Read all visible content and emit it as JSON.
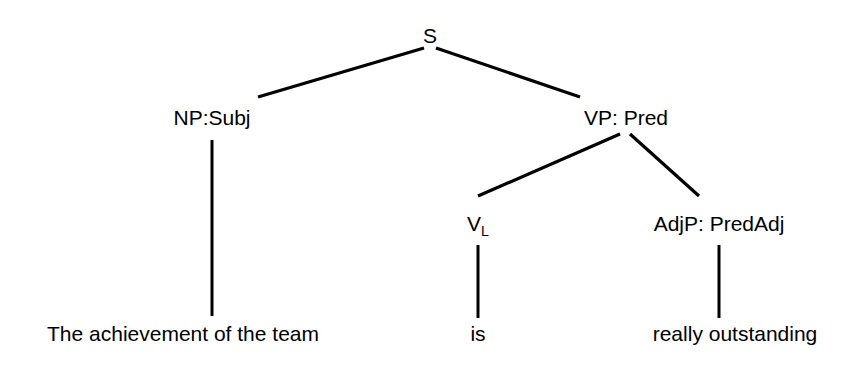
{
  "diagram": {
    "type": "syntax-tree",
    "title": "",
    "background_color": "#ffffff",
    "line_color": "#000000",
    "text_color": "#000000",
    "nodes": {
      "s": {
        "label": "S",
        "x": 430,
        "y": 40
      },
      "np_subj": {
        "label": "NP:Subj",
        "x": 212,
        "y": 122
      },
      "vp_pred": {
        "label": "VP: Pred",
        "x": 626,
        "y": 122
      },
      "v_link": {
        "label_main": "V",
        "label_sub": "L",
        "x": 478,
        "y": 228
      },
      "adjp_predadj": {
        "label": "AdjP: PredAdj",
        "x": 719,
        "y": 228
      }
    },
    "leaves": {
      "subject_text": {
        "label": "The achievement of the team",
        "x": 183,
        "y": 338
      },
      "verb_text": {
        "label": "is",
        "x": 478,
        "y": 338
      },
      "predicate_text": {
        "label": "really outstanding",
        "x": 735,
        "y": 338
      }
    },
    "edges": [
      {
        "name": "s-to-np",
        "x1": 424,
        "y1": 48,
        "x2": 258,
        "y2": 97
      },
      {
        "name": "s-to-vp",
        "x1": 436,
        "y1": 48,
        "x2": 580,
        "y2": 97
      },
      {
        "name": "np-to-subject-text",
        "x1": 212,
        "y1": 140,
        "x2": 212,
        "y2": 316
      },
      {
        "name": "vp-to-v",
        "x1": 620,
        "y1": 134,
        "x2": 478,
        "y2": 196
      },
      {
        "name": "vp-to-adjp",
        "x1": 630,
        "y1": 134,
        "x2": 699,
        "y2": 196
      },
      {
        "name": "v-to-verb-text",
        "x1": 478,
        "y1": 245,
        "x2": 478,
        "y2": 318
      },
      {
        "name": "adjp-to-predicate-text",
        "x1": 719,
        "y1": 245,
        "x2": 719,
        "y2": 318
      }
    ]
  }
}
